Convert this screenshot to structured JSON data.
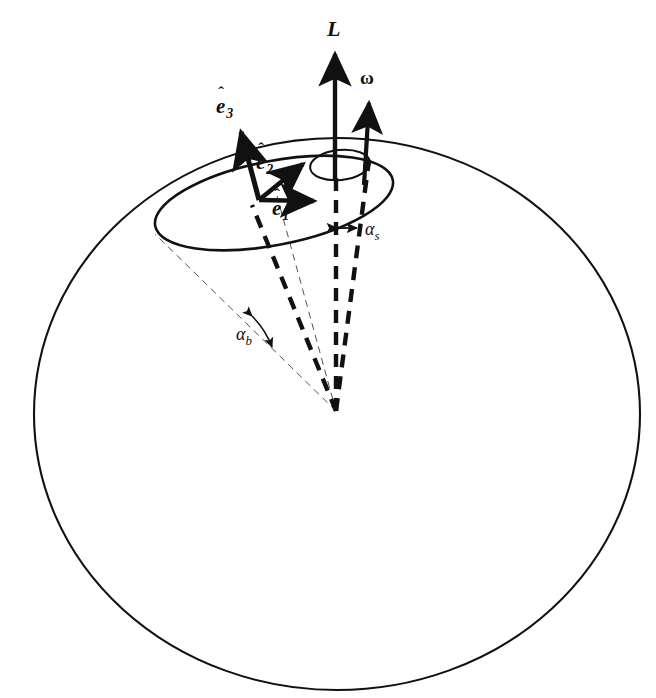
{
  "figure": {
    "background_color": "#ffffff",
    "stroke_color": "#111111",
    "width": 656,
    "height": 698
  },
  "labels": {
    "angular_momentum": "L",
    "angular_velocity": "ω",
    "e1_base": "e",
    "e1_hat": "ˆ",
    "e1_sub": "1",
    "e2_base": "e",
    "e2_hat": "ˆ",
    "e2_sub": "2",
    "e3_base": "e",
    "e3_hat": "ˆ",
    "e3_sub": "3",
    "alpha_body": "α",
    "alpha_body_sub": "b",
    "alpha_space": "α",
    "alpha_space_sub": "s"
  },
  "geometry": {
    "sphere": {
      "center_x": 337,
      "center_y": 414,
      "radius_x": 303,
      "radius_y": 276
    },
    "body_cone_ellipse": {
      "center_x": 274,
      "center_y": 203,
      "radius_x": 121,
      "radius_y": 42,
      "rotation_deg": -11
    },
    "space_cone_ellipse": {
      "center_x": 340,
      "center_y": 165,
      "radius_x": 30,
      "radius_y": 15,
      "rotation_deg": -6
    },
    "apex_x": 336,
    "apex_y": 411,
    "vector_origin_x": 259,
    "vector_origin_y": 200,
    "L_tip_x": 335,
    "L_tip_y": 47,
    "omega_tip_x": 368,
    "omega_tip_y": 96,
    "e1_tip_x": 318,
    "e1_tip_y": 201,
    "e2_tip_x": 307,
    "e2_tip_y": 160,
    "e3_tip_x": 240,
    "e3_tip_y": 129
  },
  "label_positions": {
    "L": {
      "x": 327,
      "y": 18
    },
    "omega": {
      "x": 360,
      "y": 68
    },
    "e1": {
      "x": 272,
      "y": 198
    },
    "e2": {
      "x": 256,
      "y": 152
    },
    "e3": {
      "x": 216,
      "y": 96
    },
    "alpha_b": {
      "x": 236,
      "y": 330
    },
    "alpha_s": {
      "x": 365,
      "y": 224
    }
  }
}
